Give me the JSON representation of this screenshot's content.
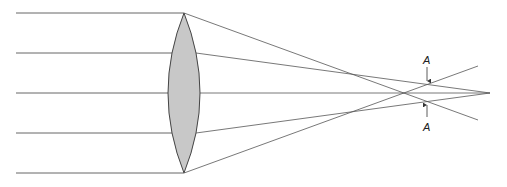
{
  "diagram": {
    "labels": {
      "top": "A",
      "bottom": "A"
    },
    "colors": {
      "lens_fill": "#c8c8c8",
      "line": "#555555",
      "text": "#222222"
    }
  }
}
